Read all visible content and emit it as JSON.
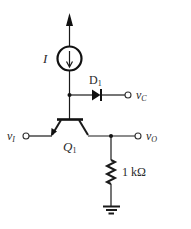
{
  "diagram": {
    "type": "circuit-schematic",
    "background": "#ffffff",
    "stroke_color": "#111111",
    "components": {
      "current_source": {
        "label": "I",
        "direction": "down",
        "icon": "current-source-icon"
      },
      "supply_arrow": {
        "icon": "supply-arrow-up-icon"
      },
      "diode": {
        "label_main": "D",
        "label_sub": "1",
        "icon": "diode-icon"
      },
      "transistor": {
        "label_main": "Q",
        "label_sub": "1",
        "type": "BJT",
        "icon": "bjt-transistor-icon"
      },
      "resistor": {
        "label": "1 kΩ",
        "icon": "resistor-icon"
      },
      "ground": {
        "icon": "ground-icon"
      }
    },
    "terminals": {
      "input": {
        "label_main": "v",
        "label_sub": "I"
      },
      "collector_out": {
        "label_main": "v",
        "label_sub": "C"
      },
      "output": {
        "label_main": "v",
        "label_sub": "O"
      }
    }
  }
}
